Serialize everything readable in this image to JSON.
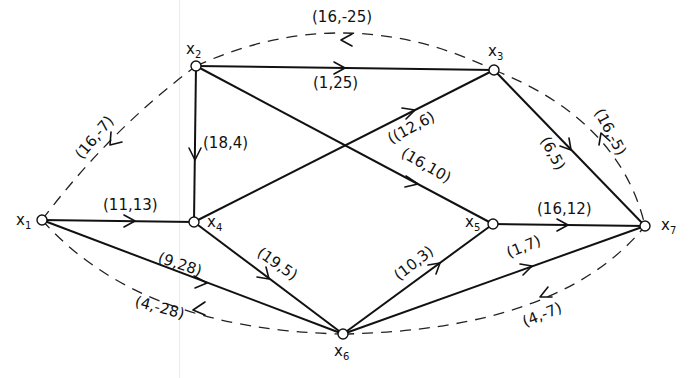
{
  "diagram": {
    "type": "flow-network",
    "nodes": [
      {
        "id": "x1",
        "label": "x",
        "sub": "1",
        "x": 42,
        "y": 220,
        "lx": 18,
        "ly": 226
      },
      {
        "id": "x2",
        "label": "x",
        "sub": "2",
        "x": 196,
        "y": 66,
        "lx": 187,
        "ly": 54
      },
      {
        "id": "x3",
        "label": "x",
        "sub": "3",
        "x": 494,
        "y": 70,
        "lx": 489,
        "ly": 56
      },
      {
        "id": "x4",
        "label": "x",
        "sub": "4",
        "x": 194,
        "y": 222,
        "lx": 208,
        "ly": 229
      },
      {
        "id": "x5",
        "label": "x",
        "sub": "5",
        "x": 493,
        "y": 224,
        "lx": 466,
        "ly": 229
      },
      {
        "id": "x6",
        "label": "x",
        "sub": "6",
        "x": 343,
        "y": 334,
        "lx": 335,
        "ly": 358
      },
      {
        "id": "x7",
        "label": "x",
        "sub": "7",
        "x": 645,
        "y": 226,
        "lx": 662,
        "ly": 232
      }
    ],
    "edges": [
      {
        "from": "x1",
        "to": "x4",
        "label": "(11,13)",
        "style": "solid"
      },
      {
        "from": "x1",
        "to": "x6",
        "label": "(9,28)",
        "style": "solid"
      },
      {
        "from": "x2",
        "to": "x3",
        "label": "(1,25)",
        "style": "solid"
      },
      {
        "from": "x2",
        "to": "x4",
        "label": "(18,4)",
        "style": "solid"
      },
      {
        "from": "x2",
        "to": "x5",
        "label": "(16,10)",
        "style": "solid"
      },
      {
        "from": "x4",
        "to": "x3",
        "label": "(12,6)",
        "style": "solid"
      },
      {
        "from": "x4",
        "to": "x6",
        "label": "(19,5)",
        "style": "solid"
      },
      {
        "from": "x3",
        "to": "x7",
        "label": "(6,5)",
        "style": "solid"
      },
      {
        "from": "x5",
        "to": "x7",
        "label": "(16,12)",
        "style": "solid"
      },
      {
        "from": "x6",
        "to": "x5",
        "label": "(10,3)",
        "style": "solid"
      },
      {
        "from": "x6",
        "to": "x7",
        "label": "(1,7)",
        "style": "solid"
      },
      {
        "from": "x3",
        "to": "x2",
        "label": "(16,-25)",
        "style": "dashed"
      },
      {
        "from": "x2",
        "to": "x1",
        "label": "(16,-7)",
        "style": "dashed"
      },
      {
        "from": "x7",
        "to": "x3",
        "label": "(16,-5)",
        "style": "dashed"
      },
      {
        "from": "x6",
        "to": "x1",
        "label": "(4,-28)",
        "style": "dashed"
      },
      {
        "from": "x7",
        "to": "x6",
        "label": "(4,-7)",
        "style": "dashed"
      }
    ]
  },
  "labels": {
    "x1": "x",
    "x1_sub": "1",
    "x2": "x",
    "x2_sub": "2",
    "x3": "x",
    "x3_sub": "3",
    "x4": "x",
    "x4_sub": "4",
    "x5": "x",
    "x5_sub": "5",
    "x6": "x",
    "x6_sub": "6",
    "x7": "x",
    "x7_sub": "7",
    "e_x1_x4": "(11,13)",
    "e_x1_x6": "(9,28)",
    "e_x2_x3": "(1,25)",
    "e_x2_x4": "(18,4)",
    "e_x2_x5": "(16,10)",
    "e_x4_x3": "((12,6)",
    "e_x4_x6": "(19,5)",
    "e_x3_x7": "(6,5)",
    "e_x5_x7": "(16,12)",
    "e_x6_x5": "(10,3)",
    "e_x6_x7": "(1,7)",
    "d_x3_x2": "(16,-25)",
    "d_x2_x1": "(16,-7)",
    "d_x7_x3": "(16,-5)",
    "d_x6_x1": "(4,-28)",
    "d_x7_x6": "(4,-7)"
  }
}
